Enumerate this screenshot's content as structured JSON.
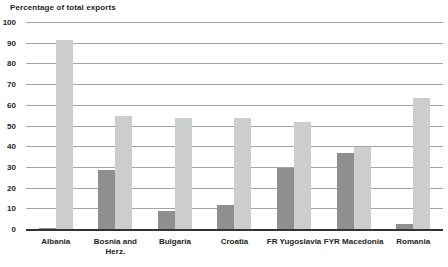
{
  "chart_data": {
    "type": "bar",
    "title": "Percentage of total exports",
    "categories": [
      "Albania",
      "Bosnia and\nHerz.",
      "Bulgaria",
      "Croatia",
      "FR Yugoslavia",
      "FYR Macedonia",
      "Romania"
    ],
    "series": [
      {
        "name": "dark-gray-series",
        "color": "#8f8f8f",
        "values": [
          1,
          29,
          9,
          12,
          30,
          37,
          3
        ]
      },
      {
        "name": "light-gray-series",
        "color": "#cccecd",
        "values": [
          92,
          55,
          54,
          54,
          52,
          40,
          64
        ]
      }
    ],
    "ylabel": "",
    "xlabel": "",
    "ylim": [
      0,
      100
    ],
    "yticks": [
      0,
      10,
      20,
      30,
      40,
      50,
      60,
      70,
      80,
      90,
      100
    ],
    "grid": "horizontal",
    "legend": "none",
    "colors": {
      "gridline": "#a3a3a3",
      "axis_line": "#333333",
      "text": "#262626",
      "background": "#ffffff"
    }
  }
}
